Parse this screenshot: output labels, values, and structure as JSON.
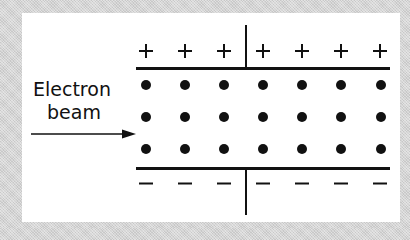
{
  "diagram": {
    "label_line1": "Electron",
    "label_line2": "beam",
    "top_plate": {
      "charge_symbol": "+",
      "count": 7,
      "x_positions": [
        146,
        185,
        224,
        263,
        302,
        341,
        380
      ]
    },
    "bottom_plate": {
      "charge_symbol": "−",
      "count": 7,
      "x_positions": [
        146,
        185,
        224,
        263,
        302,
        341,
        380
      ]
    },
    "electron_rows": [
      {
        "y": 85,
        "x_positions": [
          146,
          185,
          224,
          263,
          302,
          341,
          381
        ]
      },
      {
        "y": 117,
        "x_positions": [
          146,
          185,
          224,
          263,
          302,
          341,
          381
        ]
      },
      {
        "y": 149,
        "x_positions": [
          146,
          185,
          224,
          263,
          302,
          341,
          381
        ]
      }
    ],
    "colors": {
      "ink": "#111111",
      "panel": "#ffffff",
      "background": "#d4d4d4"
    }
  }
}
